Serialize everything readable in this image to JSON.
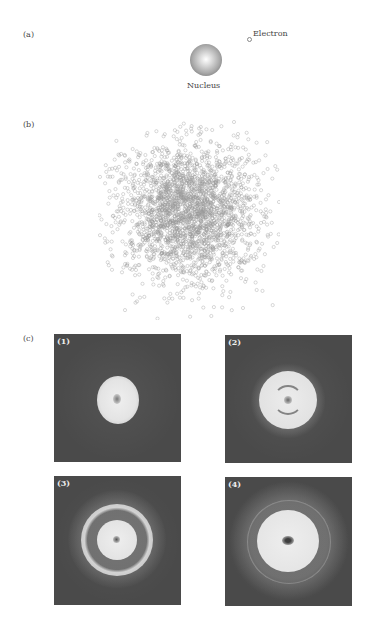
{
  "figure": {
    "panel_a": {
      "label": "(a)",
      "nucleus_label": "Nucleus",
      "electron_label": "Electron"
    },
    "panel_b": {
      "label": "(b)",
      "description": "Electron probability cloud of many small hollow gray circles around nucleus"
    },
    "panel_c": {
      "label": "(c)",
      "subpanels": [
        {
          "label": "(1)",
          "description": "Single bright central blob"
        },
        {
          "label": "(2)",
          "description": "Bright disk with inner dark arc structure"
        },
        {
          "label": "(3)",
          "description": "Bright inner disk with dark gap and outer bright ring"
        },
        {
          "label": "(4)",
          "description": "Large bright disk with dark center spot and outer speckled ring"
        }
      ]
    }
  },
  "colors": {
    "panel_background": "#4a4a4a",
    "cloud_circles": "#9a9a9a",
    "bright_region": "#e8e8e8"
  }
}
